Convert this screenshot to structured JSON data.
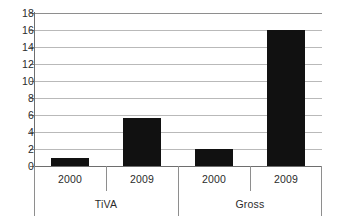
{
  "chart_data": {
    "type": "bar",
    "title": "",
    "xlabel": "",
    "ylabel": "",
    "ylim": [
      0,
      18
    ],
    "ytick_step": 2,
    "ytick_labels": [
      "18",
      "16",
      "14",
      "12",
      "10",
      "8",
      "6",
      "4",
      "2",
      "0"
    ],
    "grid": true,
    "legend": "none",
    "orientation": "vertical",
    "bar_color": "#111111",
    "gridline_color": "#b9b9b9",
    "axis_color": "#6e6e6e",
    "groups": [
      {
        "label": "TiVA",
        "categories": [
          "2000",
          "2009"
        ],
        "values": [
          1.0,
          5.7
        ]
      },
      {
        "label": "Gross",
        "categories": [
          "2000",
          "2009"
        ],
        "values": [
          2.0,
          16.0
        ]
      }
    ],
    "categories": [
      "2000",
      "2009",
      "2000",
      "2009"
    ],
    "values": [
      1.0,
      5.7,
      2.0,
      16.0
    ],
    "group_labels": [
      "TiVA",
      "Gross"
    ]
  }
}
